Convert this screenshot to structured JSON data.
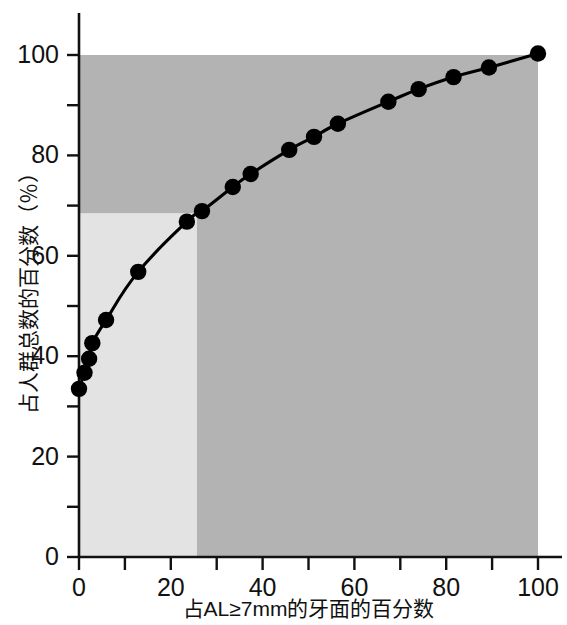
{
  "chart_data": {
    "type": "line",
    "title": "",
    "subtitle": "",
    "xlabel": "占AL≥7mm的牙面的百分数",
    "ylabel": "占人群总数的百分数（％）",
    "xlim": [
      0,
      100
    ],
    "ylim": [
      0,
      100
    ],
    "xticks": [
      0,
      20,
      40,
      60,
      80,
      100
    ],
    "xticks_minor": [
      10,
      30,
      50,
      70,
      90
    ],
    "yticks": [
      0,
      20,
      40,
      60,
      80,
      100
    ],
    "yticks_minor": [
      10,
      30,
      50,
      70,
      90
    ],
    "xtick_labels": [
      "0",
      "20",
      "40",
      "60",
      "80",
      "100"
    ],
    "ytick_labels": [
      "0",
      "20",
      "40",
      "60",
      "80",
      "100"
    ],
    "grid": false,
    "legend": "none",
    "series": [
      {
        "name": "累积百分数曲线",
        "marker": "filled-circle",
        "color": "#000000",
        "points": [
          {
            "x": 0.0,
            "y": 33.5
          },
          {
            "x": 1.2,
            "y": 36.7
          },
          {
            "x": 2.2,
            "y": 39.5
          },
          {
            "x": 2.9,
            "y": 42.6
          },
          {
            "x": 5.9,
            "y": 47.2
          },
          {
            "x": 12.9,
            "y": 56.8
          },
          {
            "x": 23.5,
            "y": 66.8
          },
          {
            "x": 26.8,
            "y": 68.9
          },
          {
            "x": 33.5,
            "y": 73.7
          },
          {
            "x": 37.4,
            "y": 76.3
          },
          {
            "x": 45.8,
            "y": 81.1
          },
          {
            "x": 51.2,
            "y": 83.7
          },
          {
            "x": 56.4,
            "y": 86.3
          },
          {
            "x": 67.4,
            "y": 90.7
          },
          {
            "x": 74.0,
            "y": 93.2
          },
          {
            "x": 81.6,
            "y": 95.6
          },
          {
            "x": 89.3,
            "y": 97.5
          },
          {
            "x": 100.0,
            "y": 100.3
          }
        ]
      }
    ],
    "shaded_regions": [
      {
        "name": "dark-shaded-region",
        "color": "#b3b3b3",
        "x_range": [
          0,
          100
        ],
        "y_range": [
          0,
          100
        ]
      },
      {
        "name": "light-shaded-region",
        "color": "#e3e3e3",
        "x_range": [
          0,
          25.7
        ],
        "y_range": [
          0,
          68.5
        ]
      }
    ],
    "reference_lines": {
      "x": 25.7,
      "y": 68.5
    }
  },
  "axes": {
    "y_title": "占人群总数的百分数（％）",
    "x_title": "占AL≥7mm的牙面的百分数",
    "y_labels": [
      "100",
      "80",
      "60",
      "40",
      "20",
      "0"
    ],
    "x_labels": [
      "0",
      "20",
      "40",
      "60",
      "80",
      "100"
    ]
  },
  "colors": {
    "axis": "#111111",
    "line": "#000000",
    "marker": "#000000",
    "shade_dark": "#b3b3b3",
    "shade_light": "#e3e3e3",
    "background": "#ffffff"
  }
}
